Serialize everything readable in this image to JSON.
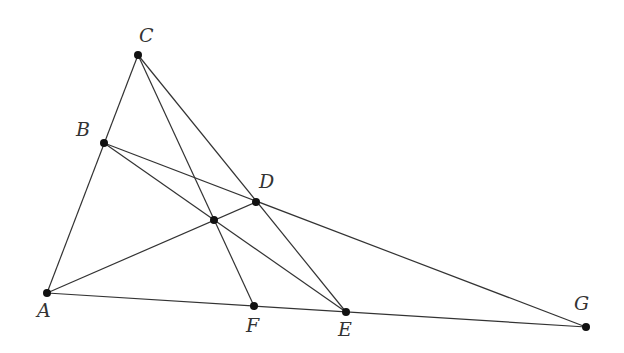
{
  "diagram": {
    "type": "geometry-construction",
    "points": {
      "A": {
        "label": "A",
        "x": 47,
        "y": 293
      },
      "B": {
        "label": "B",
        "x": 104,
        "y": 143
      },
      "C": {
        "label": "C",
        "x": 138,
        "y": 55
      },
      "D": {
        "label": "D",
        "x": 256,
        "y": 202
      },
      "E": {
        "label": "E",
        "x": 346,
        "y": 312
      },
      "F": {
        "label": "F",
        "x": 254,
        "y": 306
      },
      "G": {
        "label": "G",
        "x": 586,
        "y": 327
      },
      "P": {
        "label": "",
        "x": 214,
        "y": 220
      }
    },
    "segments": [
      [
        "A",
        "C"
      ],
      [
        "A",
        "G"
      ],
      [
        "C",
        "F"
      ],
      [
        "C",
        "E"
      ],
      [
        "B",
        "G"
      ],
      [
        "B",
        "E"
      ],
      [
        "A",
        "D"
      ]
    ],
    "line_color": "#333333",
    "point_color": "#111111"
  }
}
